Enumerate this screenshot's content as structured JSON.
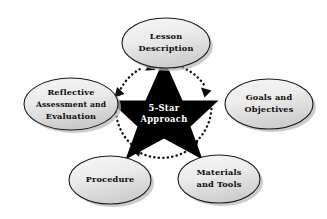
{
  "diagram": {
    "title": "5-Star Approach",
    "type": "cyclical-star-diagram",
    "core": {
      "name": "star-core",
      "line1": "5-Star",
      "line2": "Approach",
      "shape": "five-pointed-star",
      "fill_color": "#000000",
      "text_color": "#ffffff"
    },
    "flow": {
      "direction": "clockwise",
      "style": "dotted",
      "arrow_count": 5,
      "color": "#111111"
    },
    "style": {
      "background_color": "#fefefe",
      "node_fill_light": "#f2f2f2",
      "node_fill_dark": "#d2d2d2",
      "node_border_color": "#1a1a1a",
      "node_shadow_color": "#b9b9b9",
      "label_color": "#0c0c0c"
    },
    "nodes": [
      {
        "id": "lesson-description",
        "position": "top",
        "lines": [
          "Lesson",
          "Description"
        ],
        "order": 1
      },
      {
        "id": "goals-and-objectives",
        "position": "right",
        "lines": [
          "Goals and",
          "Objectives"
        ],
        "order": 2
      },
      {
        "id": "materials-and-tools",
        "position": "bottom-right",
        "lines": [
          "Materials",
          "and Tools"
        ],
        "order": 3
      },
      {
        "id": "procedure",
        "position": "bottom-left",
        "lines": [
          "Procedure"
        ],
        "order": 4
      },
      {
        "id": "reflective-assessment-and-evaluation",
        "position": "left",
        "lines": [
          "Reflective",
          "Assessment and",
          "Evaluation"
        ],
        "order": 5
      }
    ]
  }
}
